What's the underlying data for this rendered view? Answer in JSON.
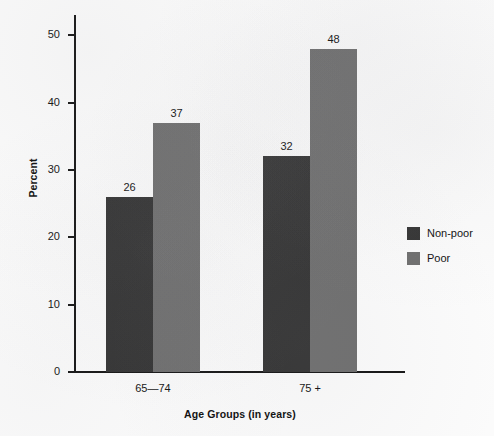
{
  "chart_data": {
    "type": "bar",
    "title": "",
    "subtitle": "",
    "xlabel": "Age Groups (in years)",
    "ylabel": "Percent",
    "categories": [
      "65—74",
      "75 +"
    ],
    "series": [
      {
        "name": "Non-poor",
        "color": "#333333",
        "values": [
          26,
          32
        ]
      },
      {
        "name": "Poor",
        "color": "#6e6e6e",
        "values": [
          37,
          48
        ]
      }
    ],
    "ylim": [
      0,
      53
    ],
    "yticks": [
      0,
      10,
      20,
      30,
      40,
      50
    ],
    "ytick_labels": [
      "0",
      "10",
      "20",
      "30",
      "40",
      "50"
    ],
    "grid": false,
    "legend_position": "right",
    "data_labels": [
      "26",
      "37",
      "32",
      "48"
    ],
    "axis_color": "#141414",
    "background_color": "#fbfbfb"
  }
}
